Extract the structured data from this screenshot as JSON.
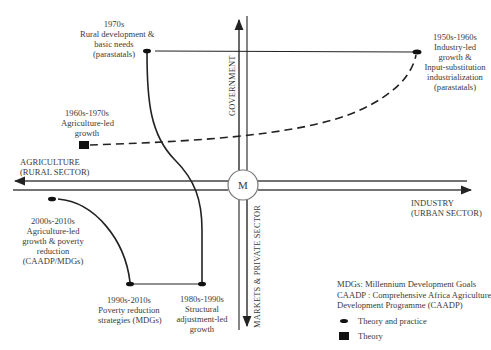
{
  "diagram": {
    "center_label": "M",
    "axes": {
      "top": "GOVERNMENT",
      "bottom": "MARKETS & PRIVATE SECTOR",
      "left": [
        "AGRICULTURE",
        "(RURAL SECTOR)"
      ],
      "right": [
        "INDUSTRY",
        "(URBAN SECTOR)"
      ]
    },
    "nodes": [
      {
        "id": "1950s",
        "lines": [
          "1950s-1960s",
          "Industry-led",
          "growth &",
          "Input-substitution",
          "industrialization",
          "(parastatals)"
        ],
        "type": "theory-and-practice"
      },
      {
        "id": "1960s",
        "lines": [
          "1960s-1970s",
          "Agriculture-led",
          "growth"
        ],
        "type": "theory"
      },
      {
        "id": "1970s",
        "lines": [
          "1970s",
          "Rural development &",
          "basic needs",
          "(parastatals)"
        ],
        "type": "theory-and-practice"
      },
      {
        "id": "1980s",
        "lines": [
          "1980s-1990s",
          "Structural",
          "adjustment-led",
          "growth"
        ],
        "type": "theory-and-practice"
      },
      {
        "id": "1990s",
        "lines": [
          "1990s-2010s",
          "Poverty reduction",
          "strategies (MDGs)"
        ],
        "type": "theory-and-practice"
      },
      {
        "id": "2000s",
        "lines": [
          "2000s-2010s",
          "Agriculture-led",
          "growth & poverty",
          "reduction",
          "(CAADP/MDGs)"
        ],
        "type": "theory-and-practice"
      }
    ]
  },
  "legend": {
    "abbreviations": [
      "MDGs: Millennium Development Goals",
      "CAADP : Comprehensive Africa Agriculture",
      "Development Programme (CAADP)"
    ],
    "items": [
      {
        "symbol": "oval-icon",
        "label": "Theory and practice"
      },
      {
        "symbol": "square-icon",
        "label": "Theory"
      }
    ]
  }
}
